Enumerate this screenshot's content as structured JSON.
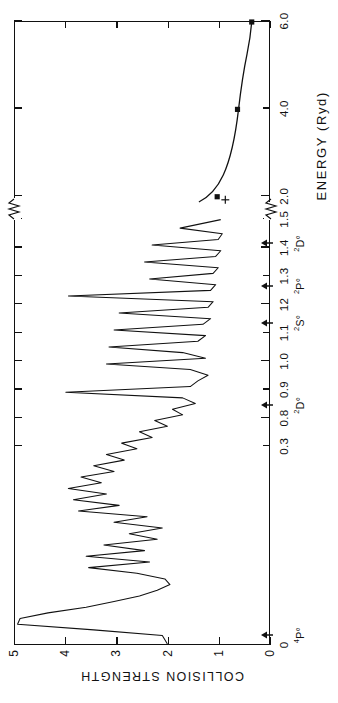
{
  "figure": {
    "orientation": "rotated-90-ccw",
    "xtitle": "ENERGY (Ryd)",
    "ytitle": "COLLISION STRENGTH",
    "frame_color": "#111111",
    "curve_color": "#111111"
  },
  "chart_data": {
    "type": "line",
    "title": "",
    "xlabel": "ENERGY (Ryd)",
    "ylabel": "COLLISION STRENGTH",
    "xlim": [
      0.0,
      6.0
    ],
    "ylim": [
      0,
      5
    ],
    "grid": false,
    "legend": "none",
    "axis_break": {
      "between": [
        1.55,
        1.85
      ],
      "note": "x-axis compressed after 1.5 Ryd"
    },
    "x_ticks": [
      {
        "value": 0.0,
        "label": "0"
      },
      {
        "value": 0.7,
        "label": "0.3"
      },
      {
        "value": 0.8,
        "label": "0.8"
      },
      {
        "value": 0.9,
        "label": "0.9"
      },
      {
        "value": 1.0,
        "label": "1.0"
      },
      {
        "value": 1.1,
        "label": "1.1"
      },
      {
        "value": 1.2,
        "label": "12"
      },
      {
        "value": 1.3,
        "label": "1.3"
      },
      {
        "value": 1.4,
        "label": "1.4"
      },
      {
        "value": 1.5,
        "label": "1.5"
      },
      {
        "value": 2.0,
        "label": "2.0"
      },
      {
        "value": 4.0,
        "label": "4.0"
      },
      {
        "value": 6.0,
        "label": "6.0"
      }
    ],
    "y_ticks": [
      {
        "value": 0,
        "label": "0"
      },
      {
        "value": 1,
        "label": "1"
      },
      {
        "value": 2,
        "label": "2"
      },
      {
        "value": 3,
        "label": "3"
      },
      {
        "value": 4,
        "label": "4"
      },
      {
        "value": 5,
        "label": "5"
      }
    ],
    "thresholds": [
      {
        "value": 0.035,
        "label": "4P°",
        "sup": "4",
        "term": "P°"
      },
      {
        "value": 0.845,
        "label": "2D°",
        "sup": "2",
        "term": "D°"
      },
      {
        "value": 1.135,
        "label": "2S°",
        "sup": "2",
        "term": "S°"
      },
      {
        "value": 1.265,
        "label": "2P°",
        "sup": "2",
        "term": "P°"
      },
      {
        "value": 1.415,
        "label": "2D°",
        "sup": "2",
        "term": "D°"
      }
    ],
    "series": [
      {
        "name": "close-coupling collision strength",
        "style": "solid-line-with-resonances",
        "x": [
          0.0,
          0.03,
          0.05,
          0.07,
          0.09,
          0.11,
          0.13,
          0.15,
          0.17,
          0.19,
          0.21,
          0.23,
          0.25,
          0.27,
          0.29,
          0.31,
          0.33,
          0.35,
          0.37,
          0.39,
          0.41,
          0.43,
          0.45,
          0.47,
          0.49,
          0.51,
          0.53,
          0.55,
          0.57,
          0.59,
          0.61,
          0.63,
          0.65,
          0.67,
          0.69,
          0.71,
          0.73,
          0.75,
          0.77,
          0.79,
          0.81,
          0.83,
          0.85,
          0.87,
          0.89,
          0.91,
          0.93,
          0.95,
          0.97,
          0.99,
          1.01,
          1.03,
          1.05,
          1.07,
          1.09,
          1.11,
          1.13,
          1.15,
          1.17,
          1.19,
          1.21,
          1.23,
          1.25,
          1.27,
          1.29,
          1.31,
          1.33,
          1.35,
          1.37,
          1.39,
          1.41,
          1.43,
          1.45,
          1.47,
          1.5
        ],
        "y": [
          2.0,
          2.1,
          3.45,
          4.95,
          4.9,
          4.35,
          3.6,
          3.05,
          2.55,
          2.2,
          1.95,
          2.05,
          2.6,
          3.55,
          2.35,
          3.6,
          2.45,
          3.25,
          2.2,
          2.75,
          2.1,
          3.05,
          2.4,
          3.75,
          2.95,
          3.85,
          3.2,
          3.95,
          3.3,
          3.7,
          3.05,
          3.45,
          2.85,
          3.2,
          2.6,
          2.9,
          2.3,
          2.55,
          2.0,
          2.25,
          1.7,
          1.9,
          1.45,
          1.7,
          4.0,
          1.55,
          1.4,
          1.2,
          1.55,
          3.2,
          1.25,
          1.7,
          3.15,
          1.4,
          1.25,
          3.05,
          1.3,
          1.15,
          2.95,
          1.2,
          1.1,
          3.95,
          1.15,
          1.05,
          2.35,
          1.1,
          1.0,
          2.45,
          1.05,
          0.95,
          2.3,
          1.0,
          0.92,
          1.75,
          0.95
        ]
      },
      {
        "name": "high-energy points (filled markers)",
        "style": "points",
        "marker": "filled-square",
        "x": [
          2.0,
          4.0,
          6.0
        ],
        "y": [
          1.02,
          0.62,
          0.34
        ]
      },
      {
        "name": "comparison point (plus)",
        "style": "points",
        "marker": "plus",
        "x": [
          1.93
        ],
        "y": [
          0.86
        ]
      }
    ],
    "annotations": [
      {
        "text": "axis break",
        "x": 1.7,
        "y": 5.0,
        "kind": "squiggle-top"
      },
      {
        "text": "axis break",
        "x": 1.7,
        "y": 0.0,
        "kind": "squiggle-bottom"
      }
    ]
  }
}
